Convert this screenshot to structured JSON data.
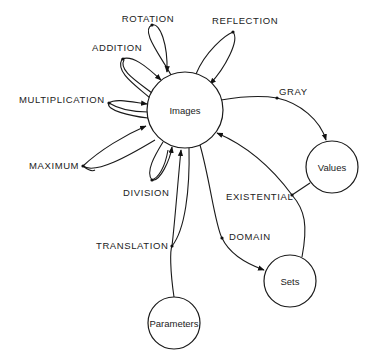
{
  "diagram": {
    "type": "state/category graph",
    "nodes": {
      "images": {
        "label": "Images",
        "cx": 185,
        "cy": 110,
        "r": 38
      },
      "values": {
        "label": "Values",
        "cx": 332,
        "cy": 167,
        "r": 26
      },
      "sets": {
        "label": "Sets",
        "cx": 290,
        "cy": 281,
        "r": 26
      },
      "parameters": {
        "label": "Parameters",
        "cx": 174,
        "cy": 323,
        "r": 26
      }
    },
    "edges": {
      "rotation": {
        "label": "ROTATION",
        "from": "Images",
        "to": "Images"
      },
      "reflection": {
        "label": "REFLECTION",
        "from": "Images",
        "to": "Images"
      },
      "addition": {
        "label": "ADDITION",
        "from": "Images",
        "to": "Images"
      },
      "multiplication": {
        "label": "MULTIPLICATION",
        "from": "Images",
        "to": "Images"
      },
      "maximum": {
        "label": "MAXIMUM",
        "from": "Images",
        "to": "Images"
      },
      "division": {
        "label": "DIVISION",
        "from": "Images",
        "to": "Images"
      },
      "gray": {
        "label": "GRAY",
        "from": "Images",
        "to": "Values"
      },
      "existential": {
        "label": "EXISTENTIAL",
        "from": "Values",
        "to": "Images"
      },
      "domain": {
        "label": "DOMAIN",
        "from": "Images",
        "to": "Sets"
      },
      "translation": {
        "label": "TRANSLATION",
        "from": "Parameters",
        "to": "Images"
      }
    }
  }
}
